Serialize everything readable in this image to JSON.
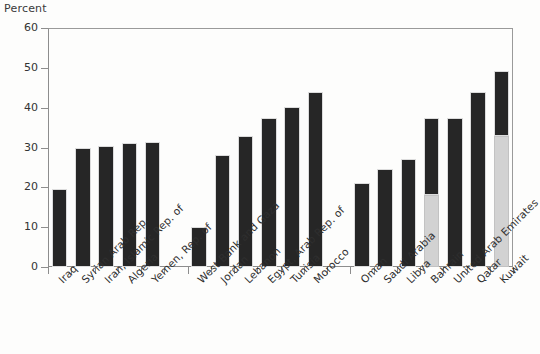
{
  "chart_data": {
    "type": "bar",
    "title": "",
    "ylabel": "Percent",
    "xlabel": "",
    "ylim": [
      0,
      60
    ],
    "yticks": [
      0,
      10,
      20,
      30,
      40,
      50,
      60
    ],
    "grid": false,
    "legend": "none",
    "stacked": true,
    "series": [
      {
        "name": "dark-segment",
        "color": "#262626",
        "values": [
          19.5,
          29.8,
          30.3,
          31.2,
          31.4,
          null,
          10.0,
          28.0,
          32.8,
          37.5,
          40.2,
          44.0,
          null,
          21.2,
          24.7,
          27.0,
          19.5,
          37.5,
          44.0,
          16.3
        ]
      },
      {
        "name": "light-segment",
        "color": "#d2d2d2",
        "values": [
          0,
          0,
          0,
          0,
          0,
          null,
          0,
          0,
          0,
          0,
          0,
          0,
          null,
          0,
          0,
          0,
          18.0,
          0,
          0,
          33.0
        ]
      }
    ],
    "categories": [
      "Iraq",
      "Syrian Arab Rep.",
      "Iran, Islamic Rep. of",
      "Algeria",
      "Yemen, Rep. of",
      "",
      "West Bank and Gaza",
      "Jordan",
      "Lebanon",
      "Egypt, Arab Rep. of",
      "Tunisia",
      "Morocco",
      "",
      "Oman",
      "Saudi Arabia",
      "Libya",
      "Bahrain",
      "United Arab Emirates",
      "Qatar",
      "Kuwait"
    ],
    "totals": [
      19.5,
      29.8,
      30.3,
      31.2,
      31.4,
      null,
      10.0,
      28.0,
      32.8,
      37.5,
      40.2,
      44.0,
      null,
      21.2,
      24.7,
      27.0,
      37.5,
      37.5,
      44.0,
      49.3
    ]
  },
  "axis": {
    "y_title": "Percent",
    "tick_labels": [
      "60",
      "50",
      "40",
      "30",
      "20",
      "10",
      "0"
    ]
  },
  "colors": {
    "dark_bar": "#262626",
    "light_bar": "#d2d2d2",
    "axis": "#8d8d8d",
    "text": "#2f2f2f",
    "background": "#fdfdfc"
  }
}
